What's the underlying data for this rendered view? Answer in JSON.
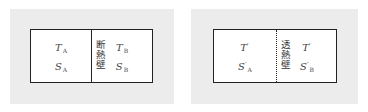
{
  "diagrams": [
    {
      "wall_type": "adiabatic",
      "wall_style": "solid",
      "wall_label": "断熱壁",
      "left_region": {
        "temperature": {
          "symbol": "T",
          "prime": "",
          "subscript": "A"
        },
        "entropy": {
          "symbol": "S",
          "prime": "",
          "subscript": "A"
        }
      },
      "right_region": {
        "temperature": {
          "symbol": "T",
          "prime": "",
          "subscript": "B"
        },
        "entropy": {
          "symbol": "S",
          "prime": "",
          "subscript": "B"
        }
      }
    },
    {
      "wall_type": "diathermal",
      "wall_style": "dotted",
      "wall_label": "透熱壁",
      "left_region": {
        "temperature": {
          "symbol": "T",
          "prime": "′",
          "subscript": ""
        },
        "entropy": {
          "symbol": "S",
          "prime": "′",
          "subscript": "A"
        }
      },
      "right_region": {
        "temperature": {
          "symbol": "T",
          "prime": "′",
          "subscript": ""
        },
        "entropy": {
          "symbol": "S",
          "prime": "′",
          "subscript": "B"
        }
      }
    }
  ],
  "colors": {
    "panel_background": "#ececec",
    "box_background": "#ffffff",
    "line": "#222222",
    "text": "#444444"
  }
}
